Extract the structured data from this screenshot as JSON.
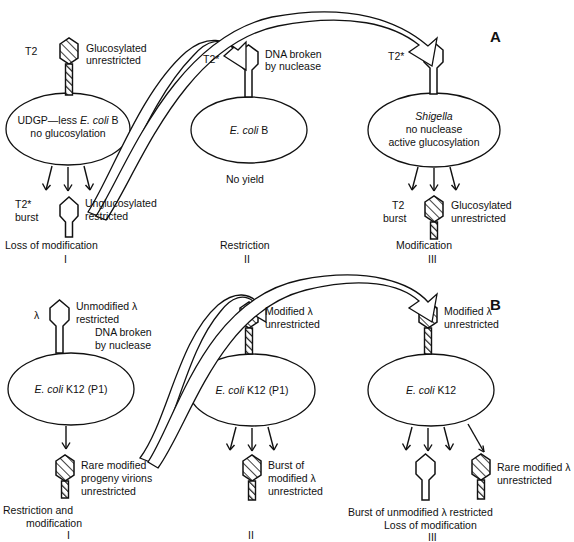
{
  "figure": {
    "title_visible": false,
    "panels": [
      {
        "letter": "A",
        "phage": "T2",
        "columns": [
          {
            "roman": "I",
            "caption": "Loss of modification",
            "input_phage_label": "T2",
            "input_phage_state": "hatched",
            "input_annotation_line1": "Glucosylated",
            "input_annotation_line2": "unrestricted",
            "host_line1": "UDGP—less E. coli B",
            "host_line2": "no glucosylation",
            "host_italic_part": "E. coli",
            "burst_arrows": 3,
            "output_phage_label_line1": "T2*",
            "output_phage_label_line2": "burst",
            "output_phage_state": "open",
            "output_annotation_line1": "Unglucosylated",
            "output_annotation_line2": "restricted"
          },
          {
            "roman": "II",
            "caption": "Restriction",
            "input_phage_label": "T2*",
            "input_phage_state": "open",
            "input_annotation_line1": "DNA broken",
            "input_annotation_line2": "by nuclease",
            "host_line1": "E. coli B",
            "host_line2": "",
            "host_italic_part": "E. coli",
            "burst_arrows": 0,
            "below_host_text": "No yield"
          },
          {
            "roman": "III",
            "caption": "Modification",
            "input_phage_label": "T2*",
            "input_phage_state": "open",
            "input_annotation_line1": "",
            "input_annotation_line2": "",
            "host_line1": "Shigella",
            "host_line2": "no nuclease",
            "host_line3": "active glucosylation",
            "host_italic_part": "Shigella",
            "burst_arrows": 3,
            "output_phage_label_line1": "T2",
            "output_phage_label_line2": "burst",
            "output_phage_state": "hatched",
            "output_annotation_line1": "Glucosylated",
            "output_annotation_line2": "unrestricted"
          }
        ]
      },
      {
        "letter": "B",
        "phage": "λ",
        "columns": [
          {
            "roman": "I",
            "caption_line1": "Restriction and",
            "caption_line2": "modification",
            "input_phage_label": "λ",
            "input_phage_state": "open",
            "input_annotation_line1": "Unmodified λ",
            "input_annotation_line2": "restricted",
            "input_annotation_line3": "DNA broken",
            "input_annotation_line4": "by nuclease",
            "host_line1": "E. coli K12 (P1)",
            "host_italic_part": "E. coli",
            "burst_arrows": 1,
            "output_phage_state": "hatched",
            "output_annotation_line1": "Rare modified",
            "output_annotation_line2": "progeny virions",
            "output_annotation_line3": "unrestricted"
          },
          {
            "roman": "II",
            "caption_line1": "",
            "caption_line2": "",
            "input_phage_label": "",
            "input_phage_state": "hatched",
            "input_annotation_line1": "Modified λ",
            "input_annotation_line2": "unrestricted",
            "host_line1": "E. coli K12 (P1)",
            "host_italic_part": "E. coli",
            "burst_arrows": 3,
            "output_phage_state": "hatched",
            "output_annotation_line1": "Burst of",
            "output_annotation_line2": "modified λ",
            "output_annotation_line3": "unrestricted"
          },
          {
            "roman": "III",
            "caption_line1": "Burst of unmodified λ restricted",
            "caption_line2": "Loss of modification",
            "input_phage_label": "",
            "input_phage_state": "hatched",
            "input_annotation_line1": "Modified λ",
            "input_annotation_line2": "unrestricted",
            "host_line1": "E. coli K12",
            "host_italic_part": "E. coli",
            "burst_arrows": 3,
            "extra_arrow": true,
            "output_phage_state": "open",
            "output_phage_2_state": "hatched",
            "output_annotation_line1": "Rare modified λ",
            "output_annotation_line2": "unrestricted"
          }
        ]
      }
    ],
    "colors": {
      "stroke": "#111111",
      "background": "#ffffff",
      "hatch": "#111111"
    }
  }
}
